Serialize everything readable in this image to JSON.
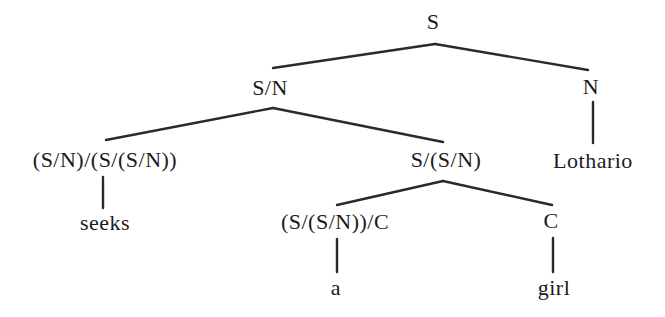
{
  "colors": {
    "background": "#ffffff",
    "text": "#1b1b1b",
    "line": "#2a2a2a"
  },
  "tree": {
    "nodes": [
      {
        "id": "root-s",
        "label": "S",
        "x": 433,
        "y": 22
      },
      {
        "id": "s-over-n",
        "label": "S/N",
        "x": 270,
        "y": 88
      },
      {
        "id": "n",
        "label": "N",
        "x": 591,
        "y": 87
      },
      {
        "id": "seeks-cat",
        "label": "(S/N)/(S/(S/N))",
        "x": 105,
        "y": 160
      },
      {
        "id": "s-over-s-n",
        "label": "S/(S/N)",
        "x": 446,
        "y": 160
      },
      {
        "id": "lothario-word",
        "label": "Lothario",
        "x": 593,
        "y": 161
      },
      {
        "id": "seeks-word",
        "label": "seeks",
        "x": 105,
        "y": 223
      },
      {
        "id": "a-cat",
        "label": "(S/(S/N))/C",
        "x": 335,
        "y": 222
      },
      {
        "id": "c",
        "label": "C",
        "x": 551,
        "y": 221
      },
      {
        "id": "a-word",
        "label": "a",
        "x": 336,
        "y": 288
      },
      {
        "id": "girl-word",
        "label": "girl",
        "x": 554,
        "y": 288
      }
    ],
    "edges": [
      {
        "from": "root-s",
        "to": "s-over-n",
        "x1": 435,
        "y1": 44,
        "x2": 273,
        "y2": 68
      },
      {
        "from": "root-s",
        "to": "n",
        "x1": 435,
        "y1": 44,
        "x2": 588,
        "y2": 70
      },
      {
        "from": "s-over-n",
        "to": "seeks-cat",
        "x1": 273,
        "y1": 108,
        "x2": 106,
        "y2": 140
      },
      {
        "from": "s-over-n",
        "to": "s-over-s-n",
        "x1": 273,
        "y1": 108,
        "x2": 443,
        "y2": 142
      },
      {
        "from": "n",
        "to": "lothario-word",
        "x1": 593,
        "y1": 102,
        "x2": 593,
        "y2": 143
      },
      {
        "from": "seeks-cat",
        "to": "seeks-word",
        "x1": 103,
        "y1": 177,
        "x2": 103,
        "y2": 208
      },
      {
        "from": "s-over-s-n",
        "to": "a-cat",
        "x1": 443,
        "y1": 181,
        "x2": 337,
        "y2": 205
      },
      {
        "from": "s-over-s-n",
        "to": "c",
        "x1": 443,
        "y1": 181,
        "x2": 552,
        "y2": 205
      },
      {
        "from": "a-cat",
        "to": "a-word",
        "x1": 337,
        "y1": 239,
        "x2": 337,
        "y2": 272
      },
      {
        "from": "c",
        "to": "girl-word",
        "x1": 553,
        "y1": 238,
        "x2": 553,
        "y2": 272
      }
    ]
  }
}
